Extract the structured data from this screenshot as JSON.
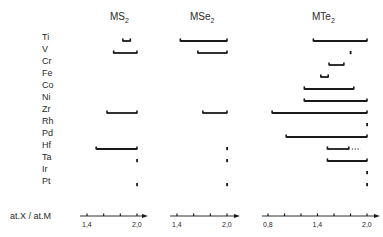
{
  "chart_data": {
    "type": "range-bar",
    "title": "",
    "xlabel": "at.X / at.M",
    "ylabel": "",
    "elements": [
      "Ti",
      "V",
      "Cr",
      "Fe",
      "Co",
      "Ni",
      "Zr",
      "Rh",
      "Pd",
      "Hf",
      "Ta",
      "Ir",
      "Pt"
    ],
    "panels": [
      {
        "name": "MS2",
        "title_main": "MS",
        "title_sub": "2",
        "xlim": [
          1.4,
          2.0
        ],
        "ticks": [
          1.4,
          1.6,
          1.8,
          2.0
        ],
        "tick_labels": [
          "1,4",
          "",
          "",
          "2,0"
        ],
        "ranges": [
          {
            "element": "Ti",
            "from": 1.83,
            "to": 1.92
          },
          {
            "element": "V",
            "from": 1.72,
            "to": 2.0
          },
          {
            "element": "Zr",
            "from": 1.64,
            "to": 2.0
          },
          {
            "element": "Hf",
            "from": 1.51,
            "to": 2.0
          },
          {
            "element": "Ta",
            "from": 2.0,
            "to": 2.0
          },
          {
            "element": "Pt",
            "from": 2.0,
            "to": 2.0
          }
        ]
      },
      {
        "name": "MSe2",
        "title_main": "MSe",
        "title_sub": "2",
        "xlim": [
          1.4,
          2.0
        ],
        "ticks": [
          1.4,
          1.6,
          1.8,
          2.0
        ],
        "tick_labels": [
          "1,4",
          "",
          "",
          "2,0"
        ],
        "ranges": [
          {
            "element": "Ti",
            "from": 1.44,
            "to": 2.0
          },
          {
            "element": "V",
            "from": 1.65,
            "to": 2.0
          },
          {
            "element": "Zr",
            "from": 1.71,
            "to": 2.0
          },
          {
            "element": "Hf",
            "from": 2.0,
            "to": 2.0
          },
          {
            "element": "Ta",
            "from": 2.0,
            "to": 2.0
          },
          {
            "element": "Pt",
            "from": 2.0,
            "to": 2.0
          }
        ]
      },
      {
        "name": "MTe2",
        "title_main": "MTe",
        "title_sub": "2",
        "xlim": [
          0.8,
          2.0
        ],
        "ticks": [
          0.8,
          1.0,
          1.2,
          1.4,
          1.6,
          1.8,
          2.0
        ],
        "tick_labels": [
          "0,8",
          "",
          "",
          "1,4",
          "",
          "",
          "2,0"
        ],
        "ranges": [
          {
            "element": "Ti",
            "from": 1.35,
            "to": 2.0
          },
          {
            "element": "V",
            "from": 1.8,
            "to": 1.8
          },
          {
            "element": "Cr",
            "from": 1.54,
            "to": 1.72
          },
          {
            "element": "Fe",
            "from": 1.44,
            "to": 1.53
          },
          {
            "element": "Co",
            "from": 1.24,
            "to": 1.84
          },
          {
            "element": "Ni",
            "from": 1.24,
            "to": 2.0
          },
          {
            "element": "Zr",
            "from": 0.85,
            "to": 2.0
          },
          {
            "element": "Rh",
            "from": 2.0,
            "to": 2.0
          },
          {
            "element": "Pd",
            "from": 1.02,
            "to": 2.0
          },
          {
            "element": "Hf",
            "from": 1.52,
            "to": 1.78,
            "dotted_extension_to": 1.92
          },
          {
            "element": "Ta",
            "from": 1.52,
            "to": 2.0
          },
          {
            "element": "Ir",
            "from": 2.0,
            "to": 2.0
          },
          {
            "element": "Pt",
            "from": 2.0,
            "to": 2.0
          }
        ]
      }
    ],
    "grid": false,
    "legend": null
  },
  "layout": {
    "label_x": 42,
    "row_y0": 37,
    "row_step": 12,
    "bar_offset": 4,
    "axis_y": 216,
    "panels_px": [
      {
        "x0": 87,
        "x1": 137,
        "axis_start": 80,
        "axis_end": 148,
        "title_x": 110
      },
      {
        "x0": 177,
        "x1": 227,
        "axis_start": 170,
        "axis_end": 240,
        "title_x": 190
      },
      {
        "x0": 268,
        "x1": 367,
        "axis_start": 262,
        "axis_end": 380,
        "title_x": 312
      }
    ]
  },
  "colors": {
    "ink": "#1a1a1a",
    "label": "#2a2a2a"
  }
}
